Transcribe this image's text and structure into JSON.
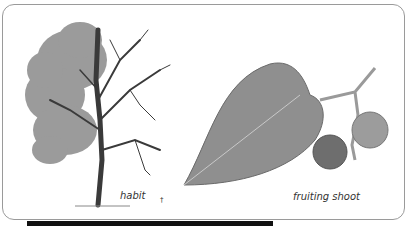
{
  "illustration": {
    "labels": {
      "habit": "habit",
      "fruiting_shoot": "fruiting shoot",
      "mark": "†"
    },
    "colors": {
      "foliage": "#7d7d7d",
      "branches": "#3a3a3a",
      "leaf": "#8f8f8f",
      "fruit": "#6e6e6e",
      "frame_border": "#9a9a9a",
      "bottom_bar": "#111111"
    }
  }
}
